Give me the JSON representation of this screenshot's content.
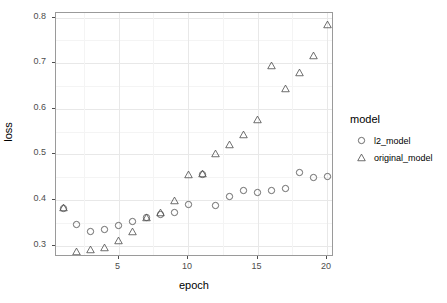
{
  "chart_data": {
    "type": "scatter",
    "title": "",
    "xlabel": "epoch",
    "ylabel": "loss",
    "xlim": [
      0.5,
      20.5
    ],
    "ylim": [
      0.275,
      0.81
    ],
    "x_ticks": [
      5,
      10,
      15,
      20
    ],
    "y_ticks": [
      "0.3",
      "0.4",
      "0.5",
      "0.6",
      "0.7",
      "0.8"
    ],
    "y_tick_values": [
      0.3,
      0.4,
      0.5,
      0.6,
      0.7,
      0.8
    ],
    "grid": true,
    "legend": {
      "title": "model",
      "position": "right",
      "entries": [
        {
          "label": "l2_model",
          "marker": "circle"
        },
        {
          "label": "original_model",
          "marker": "triangle"
        }
      ]
    },
    "x": [
      1,
      2,
      3,
      4,
      5,
      6,
      7,
      8,
      9,
      10,
      11,
      12,
      13,
      14,
      15,
      16,
      17,
      18,
      19,
      20
    ],
    "series": [
      {
        "name": "l2_model",
        "marker": "circle",
        "color": "#4d4d4d",
        "values": [
          0.381,
          0.347,
          0.332,
          0.336,
          0.345,
          0.352,
          0.361,
          0.368,
          0.372,
          0.39,
          0.457,
          0.388,
          0.407,
          0.421,
          0.416,
          0.421,
          0.426,
          0.46,
          0.45,
          0.451
        ]
      },
      {
        "name": "original_model",
        "marker": "triangle",
        "color": "#4d4d4d",
        "values": [
          0.383,
          0.288,
          0.292,
          0.295,
          0.311,
          0.33,
          0.362,
          0.373,
          0.399,
          0.457,
          0.458,
          0.502,
          0.521,
          0.544,
          0.576,
          0.695,
          0.644,
          0.68,
          0.718,
          0.785
        ]
      }
    ]
  }
}
